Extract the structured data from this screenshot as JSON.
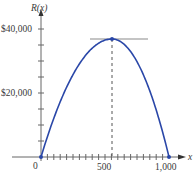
{
  "chart_data": {
    "type": "line",
    "title": "",
    "xlabel": "x",
    "ylabel": "R(x)",
    "xlim": [
      0,
      1000
    ],
    "ylim": [
      0,
      40000
    ],
    "x_ticks": [
      0,
      500,
      1000
    ],
    "x_tick_labels": [
      "0",
      "500",
      "1,000"
    ],
    "x_minor_tick_step": 50,
    "y_ticks": [
      0,
      20000,
      40000
    ],
    "y_tick_labels": [
      "",
      "$20,000",
      "$40,000"
    ],
    "y_minor_tick_step": 5000,
    "grid": false,
    "legend": null,
    "series": [
      {
        "name": "R(x)",
        "shape": "downward parabola",
        "color": "#2a47a8",
        "x": [
          0,
          100,
          200,
          300,
          400,
          500,
          600,
          700,
          800,
          900,
          1000
        ],
        "values": [
          0,
          13500,
          24000,
          31500,
          36000,
          37500,
          36000,
          31500,
          24000,
          13500,
          0
        ]
      }
    ],
    "annotations": [
      {
        "type": "point",
        "x": 0,
        "y": 0,
        "color": "#2a47a8"
      },
      {
        "type": "point",
        "x": 500,
        "y": 37500,
        "label": "maximum",
        "color": "#2a47a8"
      },
      {
        "type": "point",
        "x": 1000,
        "y": 0,
        "color": "#2a47a8"
      },
      {
        "type": "horizontal-tangent-line",
        "y": 37500,
        "x_from": 380,
        "x_to": 830,
        "color": "#8a8a8a"
      },
      {
        "type": "dashed-vertical-line",
        "x": 500,
        "y_from": 0,
        "y_to": 37500,
        "color": "#555555"
      }
    ]
  },
  "labels": {
    "y_axis": "R(x)",
    "x_axis": "x",
    "y40": "$40,000",
    "y20": "$20,000",
    "x0": "0",
    "x500": "500",
    "x1000": "1,000"
  }
}
